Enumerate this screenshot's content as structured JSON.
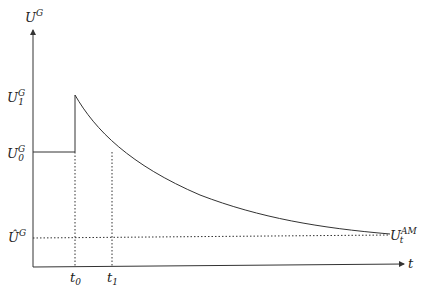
{
  "diagram": {
    "y_axis_label": "U",
    "y_axis_sup": "G",
    "x_axis_label": "t",
    "levels": [
      {
        "name": "U1G",
        "base": "U",
        "sup": "G",
        "sub": "1"
      },
      {
        "name": "U0G",
        "base": "U",
        "sup": "G",
        "sub": "0"
      },
      {
        "name": "UhatG",
        "base": "Û",
        "sup": "G",
        "sub": ""
      }
    ],
    "ticks": [
      {
        "base": "t",
        "sub": "0"
      },
      {
        "base": "t",
        "sub": "1"
      }
    ],
    "end_label": {
      "base": "U",
      "sup": "AM",
      "sub": "t"
    }
  }
}
